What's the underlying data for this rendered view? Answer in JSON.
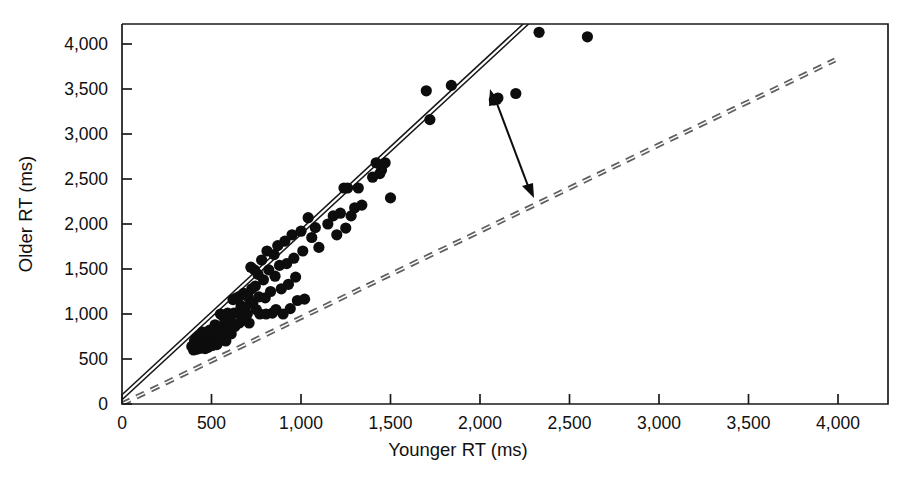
{
  "chart_data": {
    "type": "scatter",
    "title": "",
    "xlabel": "Younger RT (ms)",
    "ylabel": "Older RT (ms)",
    "xlim": [
      0,
      4250
    ],
    "ylim": [
      0,
      4250
    ],
    "xticks": [
      0,
      500,
      1000,
      1500,
      2000,
      2500,
      3000,
      3500,
      4000
    ],
    "yticks": [
      0,
      500,
      1000,
      1500,
      2000,
      2500,
      3000,
      3500,
      4000
    ],
    "xtick_labels": [
      "0",
      "500",
      "1,000",
      "1,500",
      "2,000",
      "2,500",
      "3,000",
      "3,500",
      "4,000"
    ],
    "ytick_labels": [
      "0",
      "500",
      "1,000",
      "1,500",
      "2,000",
      "2,500",
      "3,000",
      "3,500",
      "4,000"
    ],
    "grid": false,
    "legend": null,
    "marker": "filled-circle",
    "marker_color": "#0d0d0d",
    "points": [
      [
        390,
        640
      ],
      [
        400,
        600
      ],
      [
        405,
        700
      ],
      [
        410,
        655
      ],
      [
        415,
        735
      ],
      [
        420,
        610
      ],
      [
        425,
        690
      ],
      [
        430,
        760
      ],
      [
        435,
        645
      ],
      [
        440,
        620
      ],
      [
        445,
        700
      ],
      [
        450,
        800
      ],
      [
        455,
        660
      ],
      [
        460,
        720
      ],
      [
        465,
        615
      ],
      [
        470,
        690
      ],
      [
        475,
        760
      ],
      [
        480,
        630
      ],
      [
        485,
        700
      ],
      [
        490,
        820
      ],
      [
        495,
        660
      ],
      [
        500,
        715
      ],
      [
        505,
        650
      ],
      [
        510,
        760
      ],
      [
        515,
        690
      ],
      [
        520,
        880
      ],
      [
        525,
        720
      ],
      [
        530,
        660
      ],
      [
        540,
        780
      ],
      [
        545,
        700
      ],
      [
        550,
        1000
      ],
      [
        555,
        860
      ],
      [
        560,
        730
      ],
      [
        570,
        960
      ],
      [
        575,
        800
      ],
      [
        580,
        700
      ],
      [
        590,
        1010
      ],
      [
        600,
        880
      ],
      [
        605,
        960
      ],
      [
        610,
        780
      ],
      [
        620,
        1160
      ],
      [
        625,
        1010
      ],
      [
        630,
        860
      ],
      [
        640,
        1180
      ],
      [
        650,
        1020
      ],
      [
        655,
        900
      ],
      [
        660,
        1200
      ],
      [
        665,
        1090
      ],
      [
        670,
        960
      ],
      [
        680,
        1230
      ],
      [
        690,
        1080
      ],
      [
        700,
        1000
      ],
      [
        705,
        1190
      ],
      [
        710,
        900
      ],
      [
        720,
        1520
      ],
      [
        725,
        1280
      ],
      [
        730,
        1120
      ],
      [
        740,
        1490
      ],
      [
        745,
        1310
      ],
      [
        750,
        1050
      ],
      [
        760,
        1440
      ],
      [
        765,
        1190
      ],
      [
        770,
        1000
      ],
      [
        780,
        1600
      ],
      [
        790,
        1380
      ],
      [
        800,
        1180
      ],
      [
        805,
        1000
      ],
      [
        810,
        1700
      ],
      [
        820,
        1490
      ],
      [
        830,
        1250
      ],
      [
        840,
        1010
      ],
      [
        850,
        1660
      ],
      [
        855,
        1420
      ],
      [
        860,
        1050
      ],
      [
        870,
        1760
      ],
      [
        880,
        1540
      ],
      [
        890,
        1280
      ],
      [
        900,
        1000
      ],
      [
        910,
        1810
      ],
      [
        920,
        1560
      ],
      [
        930,
        1330
      ],
      [
        940,
        1060
      ],
      [
        950,
        1880
      ],
      [
        960,
        1620
      ],
      [
        970,
        1410
      ],
      [
        980,
        1150
      ],
      [
        1000,
        1920
      ],
      [
        1010,
        1700
      ],
      [
        1020,
        1165
      ],
      [
        1040,
        2070
      ],
      [
        1060,
        1850
      ],
      [
        1080,
        1960
      ],
      [
        1100,
        1740
      ],
      [
        1150,
        2000
      ],
      [
        1180,
        2090
      ],
      [
        1200,
        1880
      ],
      [
        1220,
        2120
      ],
      [
        1240,
        2400
      ],
      [
        1250,
        1955
      ],
      [
        1260,
        2400
      ],
      [
        1280,
        2090
      ],
      [
        1300,
        2180
      ],
      [
        1320,
        2400
      ],
      [
        1340,
        2210
      ],
      [
        1400,
        2520
      ],
      [
        1420,
        2680
      ],
      [
        1440,
        2560
      ],
      [
        1450,
        2600
      ],
      [
        1470,
        2680
      ],
      [
        1500,
        2290
      ],
      [
        1700,
        3480
      ],
      [
        1720,
        3160
      ],
      [
        1840,
        3540
      ],
      [
        2080,
        3380
      ],
      [
        2100,
        3400
      ],
      [
        2200,
        3450
      ],
      [
        2330,
        4130
      ],
      [
        2600,
        4080
      ]
    ],
    "reference_line": {
      "label": "unity line",
      "style": "dashed",
      "from": [
        0,
        0
      ],
      "to": [
        3970,
        3880
      ],
      "color": "#5f5f5f"
    },
    "regression_line": {
      "label": "regression fit",
      "style": "solid-double",
      "from": [
        0,
        30
      ],
      "to": [
        2370,
        4250
      ],
      "color": "#151515"
    },
    "annotation": {
      "type": "double-headed-arrow",
      "from": [
        2115,
        3350
      ],
      "to": [
        2520,
        2320
      ],
      "label": ""
    }
  }
}
